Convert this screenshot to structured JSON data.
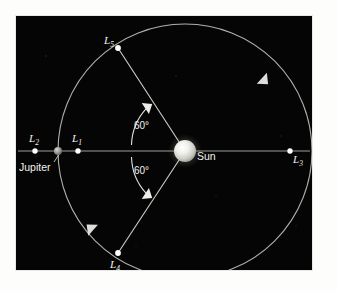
{
  "figure": {
    "background_color": "#050505",
    "page_color": "#fdfdfc",
    "line_color": "#b9b9b4",
    "label_color": "#f2f2f0"
  },
  "bodies": [
    {
      "id": "sun",
      "label": "Sun",
      "kind": "star",
      "cx": 185,
      "cy": 151,
      "radius": 11,
      "color": "#e8e8e4",
      "label_x": 197,
      "label_y": 156
    },
    {
      "id": "jupiter",
      "label": "Jupiter",
      "kind": "planet",
      "cx": 58,
      "cy": 151,
      "radius": 4,
      "color": "#8d8d88",
      "label_x": 19,
      "label_y": 167
    }
  ],
  "lagrange_points": [
    {
      "id": "L1",
      "label": "L",
      "subscript": "1",
      "cx": 78,
      "cy": 151,
      "label_x": 72,
      "label_y": 139
    },
    {
      "id": "L2",
      "label": "L",
      "subscript": "2",
      "cx": 35,
      "cy": 151,
      "label_x": 29,
      "label_y": 139
    },
    {
      "id": "L3",
      "label": "L",
      "subscript": "3",
      "cx": 290,
      "cy": 151,
      "label_x": 293,
      "label_y": 159
    },
    {
      "id": "L4",
      "label": "L",
      "subscript": "4",
      "cx": 118,
      "cy": 253,
      "label_x": 110,
      "label_y": 265
    },
    {
      "id": "L5",
      "label": "L",
      "subscript": "5",
      "cx": 118,
      "cy": 48,
      "label_x": 104,
      "label_y": 41
    }
  ],
  "orbit": {
    "label": "Jupiter orbit",
    "cx": 185,
    "cy": 151,
    "radius": 127,
    "direction": "counterclockwise"
  },
  "angles": [
    {
      "id": "angle-upper",
      "label": "60°",
      "value": 60,
      "unit": "degrees",
      "label_x": 138,
      "label_y": 127
    },
    {
      "id": "angle-lower",
      "label": "60°",
      "value": 60,
      "unit": "degrees",
      "label_x": 138,
      "label_y": 172
    }
  ],
  "axis_line": {
    "label": "Sun-Jupiter axis",
    "x1": 18,
    "x2": 310,
    "y": 151
  }
}
